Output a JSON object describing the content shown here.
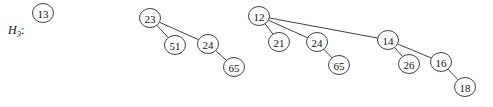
{
  "figure": {
    "label": {
      "base": "H",
      "subscript": "3",
      "colon": ":",
      "x": 8,
      "y": 34
    },
    "style": {
      "node_fill": "#ffffff",
      "node_stroke": "#2b2b2b",
      "edge_stroke": "#2b2b2b",
      "text_color": "#111111",
      "background": "#ffffff",
      "node_rx": 10.5,
      "node_ry": 9.5
    },
    "trees": [
      {
        "name": "tree-order-0",
        "root": "13",
        "nodes": [
          {
            "key": "13",
            "cx": 43,
            "cy": 13
          }
        ],
        "edges": []
      },
      {
        "name": "tree-order-2",
        "root": "23",
        "nodes": [
          {
            "key": "23",
            "cx": 150,
            "cy": 18
          },
          {
            "key": "51",
            "cx": 175,
            "cy": 45
          },
          {
            "key": "24",
            "cx": 208,
            "cy": 44
          },
          {
            "key": "65",
            "cx": 234,
            "cy": 67
          }
        ],
        "edges": [
          {
            "from": "23",
            "to": "51"
          },
          {
            "from": "23",
            "to": "24"
          },
          {
            "from": "24",
            "to": "65"
          }
        ]
      },
      {
        "name": "tree-order-3",
        "root": "12",
        "nodes": [
          {
            "key": "12",
            "cx": 259,
            "cy": 16
          },
          {
            "key": "21",
            "cx": 279,
            "cy": 42
          },
          {
            "key": "24",
            "cx": 317,
            "cy": 42
          },
          {
            "key": "65",
            "cx": 339,
            "cy": 65
          },
          {
            "key": "14",
            "cx": 388,
            "cy": 40
          },
          {
            "key": "26",
            "cx": 409,
            "cy": 64
          },
          {
            "key": "16",
            "cx": 441,
            "cy": 62
          },
          {
            "key": "18",
            "cx": 465,
            "cy": 87
          }
        ],
        "edges": [
          {
            "from": "12",
            "to": "21"
          },
          {
            "from": "12",
            "to": "24"
          },
          {
            "from": "12",
            "to": "14"
          },
          {
            "from": "24",
            "to": "65"
          },
          {
            "from": "14",
            "to": "26"
          },
          {
            "from": "14",
            "to": "16"
          },
          {
            "from": "16",
            "to": "18"
          }
        ]
      }
    ]
  }
}
